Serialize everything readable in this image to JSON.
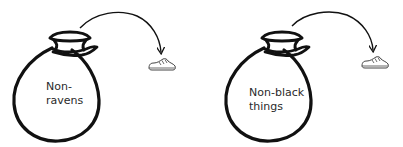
{
  "panels": [
    {
      "bag_label_line1": "Non-",
      "bag_label_line2": "ravens",
      "item": "shoe"
    },
    {
      "bag_label_line1": "Non-black",
      "bag_label_line2": "things",
      "item": "shoe"
    }
  ],
  "colors": {
    "stroke": "#111111",
    "background": "#ffffff",
    "text": "#2a2a2a",
    "shoe_stroke": "#444444"
  }
}
